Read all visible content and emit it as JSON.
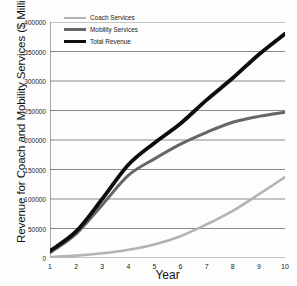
{
  "chart_data": {
    "type": "line",
    "title": "",
    "xlabel": "Year",
    "ylabel": "Revenue for Coach and Mobility Services ($ Millions)",
    "x": [
      1,
      2,
      3,
      4,
      5,
      6,
      7,
      8,
      9,
      10
    ],
    "xlim": [
      1,
      10
    ],
    "ylim": [
      0,
      400000
    ],
    "ytick_values": [
      0,
      50000,
      100000,
      150000,
      200000,
      250000,
      300000,
      350000,
      400000
    ],
    "ytick_labels": [
      "0",
      "50000",
      "100000",
      "150000",
      "200000",
      "250000",
      "300000",
      "350000",
      "400000"
    ],
    "xtick_labels": [
      "1",
      "2",
      "3",
      "4",
      "5",
      "6",
      "7",
      "8",
      "9",
      "10"
    ],
    "grid": "horizontal",
    "legend_position": "top-left",
    "series": [
      {
        "name": "Coach Services",
        "color": "#b3b3b3",
        "width": 2.6,
        "values": [
          1500,
          4000,
          8000,
          14000,
          23000,
          37000,
          57000,
          80000,
          108000,
          137000
        ]
      },
      {
        "name": "Mobility Services",
        "color": "#666666",
        "width": 3.0,
        "values": [
          9000,
          41000,
          90000,
          140000,
          168000,
          193000,
          213000,
          230000,
          240000,
          247000
        ]
      },
      {
        "name": "Total Revenue",
        "color": "#0d0d0d",
        "width": 3.8,
        "values": [
          12000,
          45000,
          100000,
          158000,
          195000,
          228000,
          268000,
          305000,
          345000,
          380000
        ]
      }
    ]
  }
}
